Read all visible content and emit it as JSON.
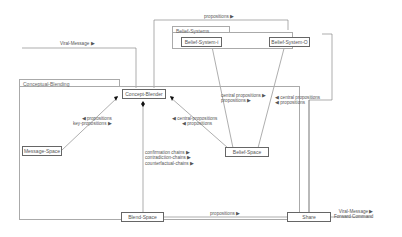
{
  "diagram": {
    "groups": {
      "conceptual_blending": "Conceptual-Blending",
      "belief_systems": "Belief-Systems"
    },
    "nodes": {
      "concept_blender": "Concept-Blender",
      "message_space": "Message-Space",
      "belief_space": "Belief-Space",
      "blend_space": "Blend-Space",
      "share": "Share",
      "belief_system_i": "Belief-System-i",
      "belief_system_o": "Belief-System-O"
    },
    "edge_labels": {
      "viral_message_top": "Viral-Message ▶",
      "propositions_top": "propositions ▶",
      "msg_props_1": "◀ propositions",
      "msg_props_2": "key-propositions ▶",
      "belief_props_1": "◀ central-propositions",
      "belief_props_2": "◀ propositions",
      "bs_central_1": "central propositions ▶",
      "bs_central_2": "propositions ▶",
      "bs_right_1": "◀ central propositions",
      "bs_right_2": "◀ propositions",
      "chains_1": "confirmation chains ▶",
      "chains_2": "contradiction-chains ▶",
      "chains_3": "counterfactual-chains ▶",
      "blend_propositions": "propositions ▶",
      "share_out_1": "Viral-Message ▶",
      "share_out_2": "Forward Command"
    },
    "colors": {
      "line": "#777777",
      "box_border": "#666666",
      "group_border": "#aaaaaa",
      "text": "#555555"
    }
  }
}
